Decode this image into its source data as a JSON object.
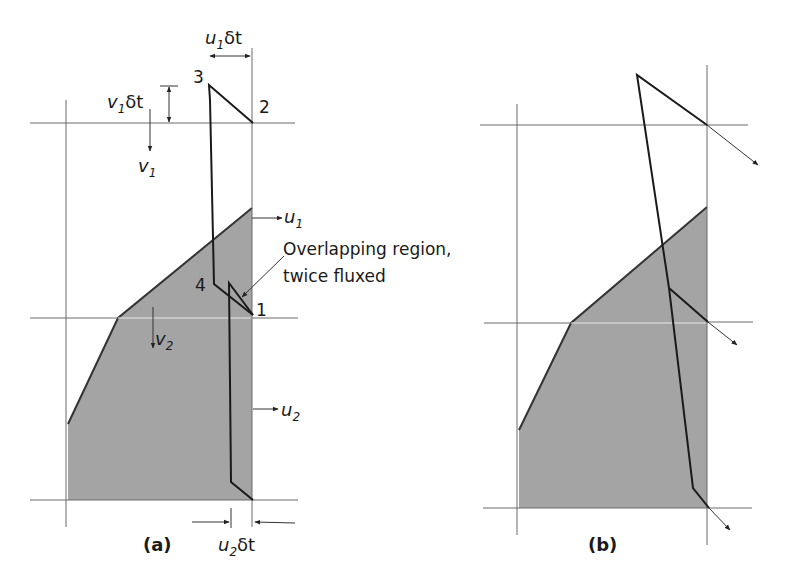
{
  "figure": {
    "panels": [
      {
        "id": "a",
        "caption": "(a)",
        "vertices": [
          {
            "label": "1",
            "x": 253,
            "y": 315
          },
          {
            "label": "2",
            "x": 252,
            "y": 123
          },
          {
            "label": "3",
            "x": 209,
            "y": 85
          },
          {
            "label": "4",
            "x": 214,
            "y": 284
          }
        ],
        "velocity_labels": {
          "u1": {
            "base": "u",
            "sub": "1"
          },
          "u2": {
            "base": "u",
            "sub": "2"
          },
          "v1": {
            "base": "v",
            "sub": "1"
          },
          "v2": {
            "base": "v",
            "sub": "2"
          }
        },
        "dimension_labels": {
          "u1dt": {
            "base": "u",
            "sub": "1",
            "suffix": "δt"
          },
          "v1dt": {
            "base": "v",
            "sub": "1",
            "suffix": "δt"
          },
          "u2dt": {
            "base": "u",
            "sub": "2",
            "suffix": "δt"
          }
        },
        "annotation": {
          "line1": "Overlapping region,",
          "line2": "twice fluxed"
        }
      },
      {
        "id": "b",
        "caption": "(b)"
      }
    ],
    "colors": {
      "shaded_region": "#a4a4a4",
      "grid_line": "#6a6a6a",
      "outline": "#1a1a1a",
      "background": "#ffffff"
    }
  }
}
